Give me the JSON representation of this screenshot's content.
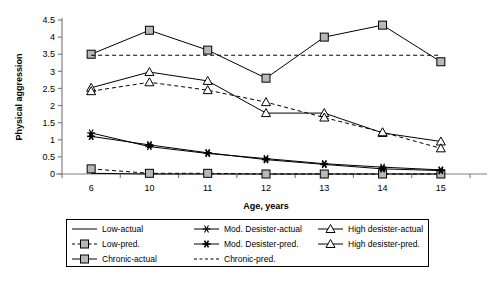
{
  "chart_data": {
    "type": "line",
    "title": "",
    "xlabel": "Age, years",
    "ylabel": "Physical aggression",
    "categories": [
      "6",
      "10",
      "11",
      "12",
      "13",
      "14",
      "15"
    ],
    "x": [
      6,
      10,
      11,
      12,
      13,
      14,
      15
    ],
    "ylim": [
      0,
      4.5
    ],
    "yticks": [
      "0",
      "0.5",
      "1",
      "1.5",
      "2",
      "2.5",
      "3",
      "3.5",
      "4",
      "4.5"
    ],
    "ytick_values": [
      0,
      0.5,
      1,
      1.5,
      2,
      2.5,
      3,
      3.5,
      4,
      4.5
    ],
    "grid": false,
    "legend_position": "bottom",
    "series": [
      {
        "name": "Low-actual",
        "values": [
          0.02,
          0.0,
          0.0,
          0.0,
          0.0,
          0.0,
          0.0
        ],
        "style": "solid",
        "marker": "none"
      },
      {
        "name": "Low-pred.",
        "values": [
          0.15,
          0.02,
          0.02,
          0.0,
          0.0,
          0.0,
          0.0
        ],
        "style": "dashed",
        "marker": "square"
      },
      {
        "name": "Chronic-actual",
        "values": [
          3.5,
          4.2,
          3.62,
          2.8,
          4.0,
          4.35,
          3.28
        ],
        "style": "solid",
        "marker": "square"
      },
      {
        "name": "Mod. Desister-actual",
        "values": [
          1.2,
          0.8,
          0.6,
          0.45,
          0.3,
          0.2,
          0.12
        ],
        "style": "solid",
        "marker": "asterisk"
      },
      {
        "name": "Mod. Desister-pred.",
        "values": [
          1.1,
          0.85,
          0.62,
          0.42,
          0.28,
          0.15,
          0.1
        ],
        "style": "solid",
        "marker": "asterisk-filled"
      },
      {
        "name": "Chronic-pred.",
        "values": [
          3.47,
          3.47,
          3.47,
          3.47,
          3.47,
          3.47,
          3.47
        ],
        "style": "dashed",
        "marker": "none"
      },
      {
        "name": "High desister-actual",
        "values": [
          2.52,
          2.98,
          2.72,
          1.78,
          1.78,
          1.2,
          0.95
        ],
        "style": "solid",
        "marker": "triangle"
      },
      {
        "name": "High desister-pred.",
        "values": [
          2.42,
          2.68,
          2.45,
          2.1,
          1.65,
          1.22,
          0.75
        ],
        "style": "dashed",
        "marker": "triangle"
      }
    ]
  },
  "legend": {
    "entries": [
      {
        "label": "Low-actual",
        "style": "solid",
        "marker": "none"
      },
      {
        "label": "Mod. Desister-actual",
        "style": "solid",
        "marker": "asterisk"
      },
      {
        "label": "High desister-actual",
        "style": "solid",
        "marker": "triangle"
      },
      {
        "label": "Low-pred.",
        "style": "dashed",
        "marker": "square"
      },
      {
        "label": "Mod. Desister-pred.",
        "style": "solid",
        "marker": "asterisk-filled"
      },
      {
        "label": "High desister-pred.",
        "style": "solid",
        "marker": "triangle"
      },
      {
        "label": "Chronic-actual",
        "style": "solid",
        "marker": "square"
      },
      {
        "label": "Chronic-pred.",
        "style": "dashed",
        "marker": "none"
      },
      {
        "label": "",
        "style": "none",
        "marker": "none"
      }
    ]
  },
  "colors": {
    "line": "#000000",
    "marker_fill": "#b8b8b8",
    "axis": "#808080",
    "background": "#ffffff"
  }
}
